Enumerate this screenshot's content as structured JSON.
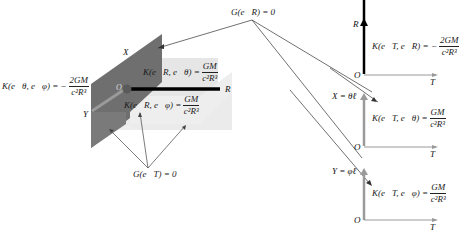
{
  "diagram": {
    "left_panel": {
      "axis_labels": {
        "x": "X",
        "y": "Y",
        "r": "R",
        "origin": "O"
      },
      "eq_theta_phi": {
        "lhs": "K(e⃗θ, e⃗φ) = −",
        "num": "2GM",
        "den": "c²R³"
      },
      "eq_R_theta": {
        "lhs": "K(e⃗R, e⃗θ) =",
        "num": "GM",
        "den": "c²R³"
      },
      "eq_R_phi": {
        "lhs": "K(e⃗R, e⃗φ) =",
        "num": "GM",
        "den": "c²R³"
      },
      "g_eT": "G(e⃗T) = 0",
      "g_eR": "G(e⃗R) = 0"
    },
    "right_panels": [
      {
        "vertical_axis": "R",
        "horizontal_axis": "T",
        "origin": "O",
        "eq": {
          "lhs": "K(e⃗T, e⃗R) = −",
          "num": "2GM",
          "den": "c²R³"
        }
      },
      {
        "vertical_axis": "X = θ̇ℓ",
        "horizontal_axis": "T",
        "origin": "O",
        "eq": {
          "lhs": "K(e⃗T, e⃗θ) =",
          "num": "GM",
          "den": "c²R³"
        }
      },
      {
        "vertical_axis": "Y = φ̇ℓ",
        "horizontal_axis": "T",
        "origin": "O",
        "eq": {
          "lhs": "K(e⃗T, e⃗φ) =",
          "num": "GM",
          "den": "c²R³"
        }
      }
    ],
    "colors": {
      "dark_plane": "#6e6e6e",
      "light_plane": "#e4e4e4",
      "lighter_plane": "#efefef",
      "r_axis": "#000000",
      "gray_axis": "#9a9a9a"
    }
  }
}
